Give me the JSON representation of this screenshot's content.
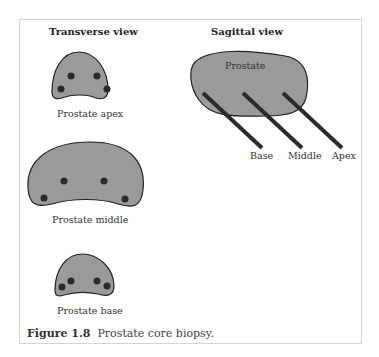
{
  "diagram": {
    "transverse_title": "Transverse view",
    "sagittal_title": "Sagittal view",
    "sections": [
      {
        "label": "Prostate apex"
      },
      {
        "label": "Prostate middle"
      },
      {
        "label": "Prostate base"
      }
    ],
    "sagittal": {
      "organ_label": "Prostate",
      "needles": [
        {
          "label": "Base"
        },
        {
          "label": "Middle"
        },
        {
          "label": "Apex"
        }
      ]
    },
    "colors": {
      "organ_fill": "#9a9a9a",
      "outline": "#222222",
      "core": "#2a2a2a",
      "needle": "#2a2a2a"
    }
  },
  "caption": {
    "number": "Figure 1.8",
    "text": "Prostate core biopsy."
  }
}
